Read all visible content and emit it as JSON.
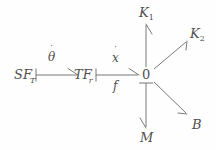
{
  "diagram": {
    "type": "bond-graph",
    "title": "",
    "background_color": "#fefefe",
    "stroke_color": "#6b6b6b",
    "text_color": "#4f4f4f",
    "width": 216,
    "height": 150,
    "nodes": [
      {
        "id": "sf",
        "label": "SF",
        "subscript": "T",
        "x": 26,
        "y": 75,
        "kind": "source-of-flow"
      },
      {
        "id": "tf",
        "label": "TF",
        "subscript": "r",
        "x": 86,
        "y": 75,
        "kind": "transformer"
      },
      {
        "id": "j0",
        "label": "0",
        "subscript": "",
        "x": 146,
        "y": 75,
        "kind": "zero-junction"
      },
      {
        "id": "k1",
        "label": "K",
        "subscript": "1",
        "x": 148,
        "y": 14,
        "kind": "capacitance"
      },
      {
        "id": "k2",
        "label": "K",
        "subscript": "2",
        "x": 190,
        "y": 35,
        "kind": "capacitance"
      },
      {
        "id": "b",
        "label": "B",
        "subscript": "",
        "x": 194,
        "y": 126,
        "kind": "resistance"
      },
      {
        "id": "m",
        "label": "M",
        "subscript": "",
        "x": 148,
        "y": 140,
        "kind": "inertia"
      }
    ],
    "bonds": [
      {
        "id": "bond-sf-tf",
        "from": "sf",
        "to": "tf",
        "effort_label": "",
        "flow_label": "θ",
        "flow_has_dot": true,
        "causality": "at-source"
      },
      {
        "id": "bond-tf-j0",
        "from": "tf",
        "to": "j0",
        "effort_label": "f",
        "flow_label": "x",
        "flow_has_dot": true,
        "causality": "at-source"
      },
      {
        "id": "bond-j0-k1",
        "from": "j0",
        "to": "k1",
        "effort_label": "",
        "flow_label": "",
        "flow_has_dot": false,
        "causality": "none"
      },
      {
        "id": "bond-j0-k2",
        "from": "j0",
        "to": "k2",
        "effort_label": "",
        "flow_label": "",
        "flow_has_dot": false,
        "causality": "none"
      },
      {
        "id": "bond-j0-b",
        "from": "j0",
        "to": "b",
        "effort_label": "",
        "flow_label": "",
        "flow_has_dot": false,
        "causality": "none"
      },
      {
        "id": "bond-j0-m",
        "from": "j0",
        "to": "m",
        "effort_label": "",
        "flow_label": "",
        "flow_has_dot": false,
        "causality": "at-junction"
      }
    ],
    "labels": {
      "sf": "SF",
      "sf_sub": "T",
      "tf": "TF",
      "tf_sub": "r",
      "junction_zero": "0",
      "k1": "K",
      "k1_sub": "1",
      "k2": "K",
      "k2_sub": "2",
      "b": "B",
      "m": "M",
      "theta": "θ",
      "xdot": "x",
      "f": "f",
      "dot_accent": "˙"
    }
  }
}
